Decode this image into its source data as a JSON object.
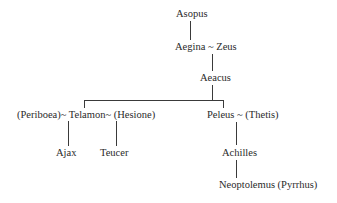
{
  "diagram": {
    "type": "family-tree",
    "nodes": {
      "asopus": "Asopus",
      "aegina_zeus": "Aegina ~ Zeus",
      "aeacus": "Aeacus",
      "telamon_line": "(Periboea)~ Telamon~ (Hesione)",
      "peleus_line": "Peleus ~ (Thetis)",
      "ajax": "Ajax",
      "teucer": "Teucer",
      "achilles": "Achilles",
      "neoptolemus": "Neoptolemus (Pyrrhus)"
    },
    "edges": [
      [
        "Asopus",
        "Aegina"
      ],
      [
        "Zeus",
        "Aeacus"
      ],
      [
        "Aeacus",
        "Telamon"
      ],
      [
        "Aeacus",
        "Peleus"
      ],
      [
        "Periboea~Telamon",
        "Ajax"
      ],
      [
        "Telamon~Hesione",
        "Teucer"
      ],
      [
        "Peleus~Thetis",
        "Achilles"
      ],
      [
        "Achilles",
        "Neoptolemus (Pyrrhus)"
      ]
    ]
  }
}
